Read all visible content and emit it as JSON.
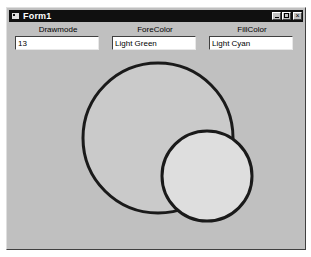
{
  "window": {
    "title": "Form1",
    "controls": {
      "minimize": "minimize",
      "maximize": "maximize",
      "close": "×"
    }
  },
  "fields": [
    {
      "label": "Drawmode",
      "value": "13"
    },
    {
      "label": "ForeColor",
      "value": "Light Green"
    },
    {
      "label": "FillColor",
      "value": "Light Cyan"
    }
  ],
  "drawing": {
    "large_circle": {
      "cx": 151,
      "cy": 130,
      "r": 75,
      "fill": "#cacaca",
      "stroke": "#1a1a1a",
      "stroke_width": 3
    },
    "small_circle": {
      "cx": 200,
      "cy": 168,
      "r": 45,
      "fill": "#dedede",
      "stroke": "#1a1a1a",
      "stroke_width": 3
    }
  },
  "colors": {
    "form_background": "#c0c0c0",
    "title_bar": "#101010"
  }
}
